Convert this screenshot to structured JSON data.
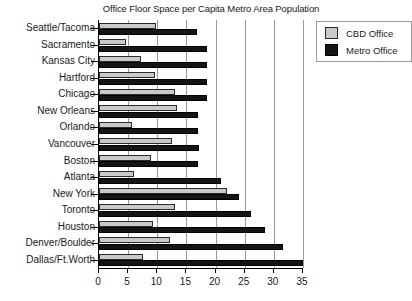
{
  "chart_data": {
    "type": "bar",
    "orientation": "horizontal",
    "title": "Office Floor Space per Capita Metro Area Population",
    "xlabel": "",
    "ylabel": "",
    "xlim": [
      0,
      35
    ],
    "xticks": [
      0,
      5,
      10,
      15,
      20,
      25,
      30,
      35
    ],
    "grid": true,
    "grid_axis": "x",
    "legend": {
      "position": "top-right",
      "entries": [
        {
          "name": "CBD Office",
          "color": "#c9c9c9"
        },
        {
          "name": "Metro Office",
          "color": "#151515"
        }
      ]
    },
    "categories": [
      "Seattle/Tacoma",
      "Sacramento",
      "Kansas City",
      "Hartford",
      "Chicago",
      "New Orleans",
      "Orlando",
      "Vancouver",
      "Boston",
      "Atlanta",
      "New York",
      "Toronto",
      "Houston",
      "Denver/Boulder",
      "Dallas/Ft.Worth"
    ],
    "series": [
      {
        "name": "CBD Office",
        "color": "#c9c9c9",
        "values": [
          9.8,
          4.6,
          7.2,
          9.6,
          13.0,
          13.4,
          5.6,
          12.5,
          9.0,
          6.0,
          22.0,
          13.0,
          9.2,
          12.2,
          7.5
        ]
      },
      {
        "name": "Metro Office",
        "color": "#151515",
        "values": [
          16.8,
          18.6,
          18.6,
          18.6,
          18.6,
          17.0,
          17.0,
          17.2,
          17.0,
          21.0,
          24.0,
          26.0,
          28.5,
          31.5,
          35.0
        ]
      }
    ]
  },
  "axis": {
    "tick_labels": [
      "0",
      "5",
      "10",
      "15",
      "20",
      "25",
      "30",
      "35"
    ]
  }
}
